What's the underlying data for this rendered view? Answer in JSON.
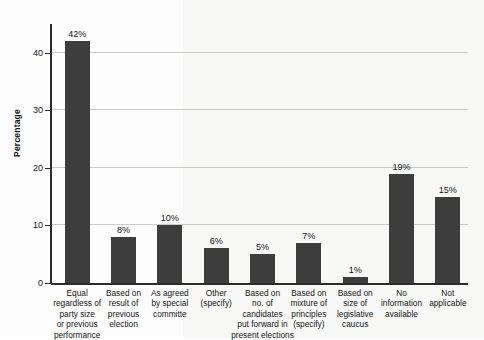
{
  "chart_data": {
    "type": "bar",
    "title": "",
    "xlabel": "",
    "ylabel": "Percentage",
    "ylim": [
      0,
      45
    ],
    "yticks": [
      0,
      10,
      20,
      30,
      40
    ],
    "ytick_labels": [
      "0",
      "10",
      "20",
      "30",
      "40"
    ],
    "grid": true,
    "legend": "none",
    "bar_color": "#3d3d3d",
    "gridline_color": "#c9c9c9",
    "axis_color": "#2b2b2b",
    "value_suffix": "%",
    "categories": [
      "Equal\nregardless of\nparty size\nor previous\nperformance",
      "Based on\nresult of\nprevious\nelection",
      "As agreed\nby special\ncommitte",
      "Other\n(specify)",
      "Based on\nno. of\ncandidates\nput forward in\npresent elections",
      "Based on\nmixture of\nprinciples\n(specify)",
      "Based on\nsize of\nlegislative\ncaucus",
      "No\ninformation\navailable",
      "Not\napplicable"
    ],
    "values": [
      42,
      8,
      10,
      6,
      5,
      7,
      1,
      19,
      15
    ],
    "value_labels": [
      "42%",
      "8%",
      "10%",
      "6%",
      "5%",
      "7%",
      "1%",
      "19%",
      "15%"
    ]
  }
}
